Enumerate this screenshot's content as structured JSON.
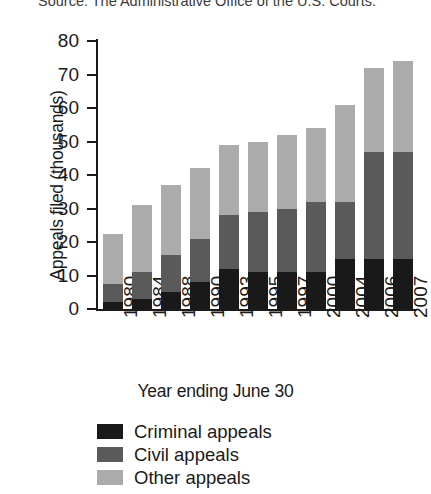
{
  "figure": {
    "source_note": "Source: The Administrative Office of the U.S. Courts."
  },
  "chart_data": {
    "type": "bar",
    "subtype": "stacked-vertical",
    "title": "",
    "xlabel": "Year ending June 30",
    "ylabel": "Appeals filed (thousands)",
    "ylim": [
      0,
      80
    ],
    "yticks": [
      0,
      10,
      20,
      30,
      40,
      50,
      60,
      70,
      80
    ],
    "ytick_labels": [
      "0",
      "10",
      "20",
      "30",
      "40",
      "50",
      "60",
      "70",
      "80"
    ],
    "grid": false,
    "legend_position": "below",
    "categories": [
      "1980",
      "1984",
      "1988",
      "1990",
      "1993",
      "1995",
      "1997",
      "2000",
      "2004",
      "2006",
      "2007"
    ],
    "series": [
      {
        "name": "Criminal appeals",
        "color": "#191919",
        "values": [
          2,
          3,
          5,
          8,
          12,
          11,
          11,
          11,
          15,
          15,
          15
        ]
      },
      {
        "name": "Civil appeals",
        "color": "#5a5a5a",
        "values": [
          5.5,
          8,
          11,
          13,
          16,
          18,
          19,
          21,
          17,
          32,
          32
        ]
      },
      {
        "name": "Other appeals",
        "color": "#ababab",
        "values": [
          15,
          20,
          21,
          21,
          21,
          21,
          22,
          22,
          29,
          25,
          27
        ]
      }
    ],
    "totals": [
      22.5,
      31,
      37,
      42,
      49,
      50,
      52,
      54,
      61,
      72,
      74
    ]
  }
}
